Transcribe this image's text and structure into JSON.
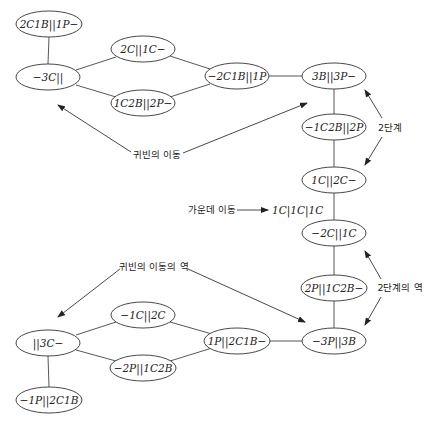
{
  "diagram": {
    "nodes": [
      {
        "id": "n1",
        "label": "2C1B||1P−",
        "cx": 49,
        "cy": 24
      },
      {
        "id": "n2",
        "label": "−3C||",
        "cx": 48,
        "cy": 77
      },
      {
        "id": "n3",
        "label": "2C||1C−",
        "cx": 143,
        "cy": 49
      },
      {
        "id": "n4",
        "label": "1C2B||2P−",
        "cx": 143,
        "cy": 103
      },
      {
        "id": "n5",
        "label": "−2C1B||1P",
        "cx": 237,
        "cy": 76
      },
      {
        "id": "n6",
        "label": "3B||3P−",
        "cx": 334,
        "cy": 76
      },
      {
        "id": "n7",
        "label": "−1C2B||2P",
        "cx": 334,
        "cy": 127
      },
      {
        "id": "n8",
        "label": "1C||2C−",
        "cx": 334,
        "cy": 180
      },
      {
        "id": "n9",
        "label": "−2C||1C",
        "cx": 334,
        "cy": 233
      },
      {
        "id": "n10",
        "label": "2P||1C2B−",
        "cx": 334,
        "cy": 288
      },
      {
        "id": "n11",
        "label": "−3P||3B",
        "cx": 334,
        "cy": 341
      },
      {
        "id": "n12",
        "label": "1P||2C1B−",
        "cx": 237,
        "cy": 341
      },
      {
        "id": "n13",
        "label": "−1C||2C",
        "cx": 143,
        "cy": 315
      },
      {
        "id": "n14",
        "label": "−2P||1C2B",
        "cx": 143,
        "cy": 368
      },
      {
        "id": "n15",
        "label": "||3C−",
        "cx": 48,
        "cy": 343
      },
      {
        "id": "n16",
        "label": "−1P||2C1B",
        "cx": 49,
        "cy": 400
      }
    ],
    "edges": [
      [
        "n1",
        "n2"
      ],
      [
        "n2",
        "n3"
      ],
      [
        "n2",
        "n4"
      ],
      [
        "n3",
        "n5"
      ],
      [
        "n4",
        "n5"
      ],
      [
        "n5",
        "n6"
      ],
      [
        "n6",
        "n7"
      ],
      [
        "n7",
        "n8"
      ],
      [
        "n8",
        "n9"
      ],
      [
        "n9",
        "n10"
      ],
      [
        "n10",
        "n11"
      ],
      [
        "n11",
        "n12"
      ],
      [
        "n12",
        "n13"
      ],
      [
        "n12",
        "n14"
      ],
      [
        "n13",
        "n15"
      ],
      [
        "n14",
        "n15"
      ],
      [
        "n15",
        "n16"
      ]
    ],
    "annotations": {
      "vip_move": "귀빈의 이동",
      "vip_move_inverse": "귀빈의 이동의 역",
      "middle_move": "가운데 이동",
      "middle_state": "1C|1C|1C",
      "step2": "2단계",
      "step2_inverse": "2단계의 역"
    }
  }
}
